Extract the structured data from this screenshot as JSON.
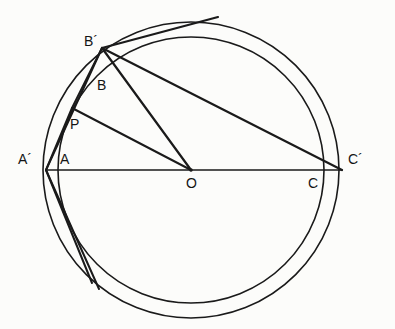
{
  "figure": {
    "type": "geometry-diagram",
    "width": 395,
    "height": 329,
    "background_color": "#fcfcfa",
    "stroke_color": "#1a1a1a"
  },
  "circles": [
    {
      "name": "inner-circle",
      "cx": 191,
      "cy": 170,
      "r": 133,
      "stroke_width": 1.6
    },
    {
      "name": "outer-circle",
      "cx": 191,
      "cy": 170,
      "r": 148,
      "stroke_width": 1.6
    }
  ],
  "points": [
    {
      "name": "A-prime",
      "label": "A´",
      "x": 46,
      "y": 170,
      "label_x": 18,
      "label_y": 152
    },
    {
      "name": "A",
      "label": "A",
      "x": 58,
      "y": 170,
      "label_x": 60,
      "label_y": 152
    },
    {
      "name": "B-prime",
      "label": "B´",
      "x": 102,
      "y": 48,
      "label_x": 84,
      "label_y": 34
    },
    {
      "name": "B",
      "label": "B",
      "x": 97,
      "y": 87,
      "label_x": 97,
      "label_y": 78
    },
    {
      "name": "P",
      "label": "P",
      "x": 72,
      "y": 108,
      "label_x": 70,
      "label_y": 117
    },
    {
      "name": "O",
      "label": "O",
      "x": 191,
      "y": 170,
      "label_x": 186,
      "label_y": 176
    },
    {
      "name": "C",
      "label": "C",
      "x": 324,
      "y": 170,
      "label_x": 308,
      "label_y": 176
    },
    {
      "name": "C-prime",
      "label": "C´",
      "x": 342,
      "y": 170,
      "label_x": 348,
      "label_y": 152
    }
  ],
  "segments": [
    {
      "name": "diameter-A-prime-to-C-prime",
      "x1": 46,
      "y1": 170,
      "x2": 342,
      "y2": 170,
      "stroke_width": 1.5
    },
    {
      "name": "chord-B-prime-to-C-prime",
      "x1": 102,
      "y1": 48,
      "x2": 342,
      "y2": 170,
      "stroke_width": 2.2
    },
    {
      "name": "radius-B-prime-to-O",
      "x1": 102,
      "y1": 48,
      "x2": 191,
      "y2": 170,
      "stroke_width": 2.2
    },
    {
      "name": "segment-P-to-O",
      "x1": 72,
      "y1": 108,
      "x2": 191,
      "y2": 170,
      "stroke_width": 2.0
    },
    {
      "name": "segment-B-prime-to-P",
      "x1": 102,
      "y1": 48,
      "x2": 72,
      "y2": 108,
      "stroke_width": 2.0
    },
    {
      "name": "chord-B-prime-to-arc-top",
      "x1": 102,
      "y1": 48,
      "x2": 218,
      "y2": 17,
      "stroke_width": 2.2
    },
    {
      "name": "chord-A-prime-to-B-prime",
      "x1": 46,
      "y1": 170,
      "x2": 102,
      "y2": 48,
      "stroke_width": 2.0
    },
    {
      "name": "segment-A-prime-to-P",
      "x1": 46,
      "y1": 170,
      "x2": 72,
      "y2": 108,
      "stroke_width": 2.0
    },
    {
      "name": "chord-A-prime-to-lower-left",
      "x1": 46,
      "y1": 170,
      "x2": 99,
      "y2": 289,
      "stroke_width": 2.0
    },
    {
      "name": "chord-A-prime-to-lower-arc",
      "x1": 46,
      "y1": 170,
      "x2": 92,
      "y2": 283,
      "stroke_width": 2.0
    }
  ]
}
